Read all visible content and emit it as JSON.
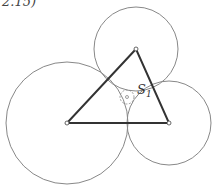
{
  "caption": "2.15)",
  "diagram": {
    "type": "three mutually tangent circles with triangle of centers and inner Soddy circle",
    "vertices": [
      {
        "name": "top",
        "x": 136,
        "y": 49
      },
      {
        "name": "left",
        "x": 67,
        "y": 123
      },
      {
        "name": "right",
        "x": 169,
        "y": 123
      }
    ],
    "circles": [
      {
        "name": "top-circle",
        "cx": 136,
        "cy": 49,
        "r": 42
      },
      {
        "name": "left-circle",
        "cx": 67,
        "cy": 123,
        "r": 61
      },
      {
        "name": "right-circle",
        "cx": 169,
        "cy": 123,
        "r": 42
      }
    ],
    "inner_circle": {
      "name": "soddy-circle",
      "cx": 127,
      "cy": 97,
      "r": 7,
      "style": "dashed"
    },
    "label": {
      "text": "S",
      "subscript": "1",
      "x": 137,
      "y": 94
    },
    "colors": {
      "triangle": "#333333",
      "circle": "#888888",
      "vertex_fill": "#ffffff"
    }
  }
}
